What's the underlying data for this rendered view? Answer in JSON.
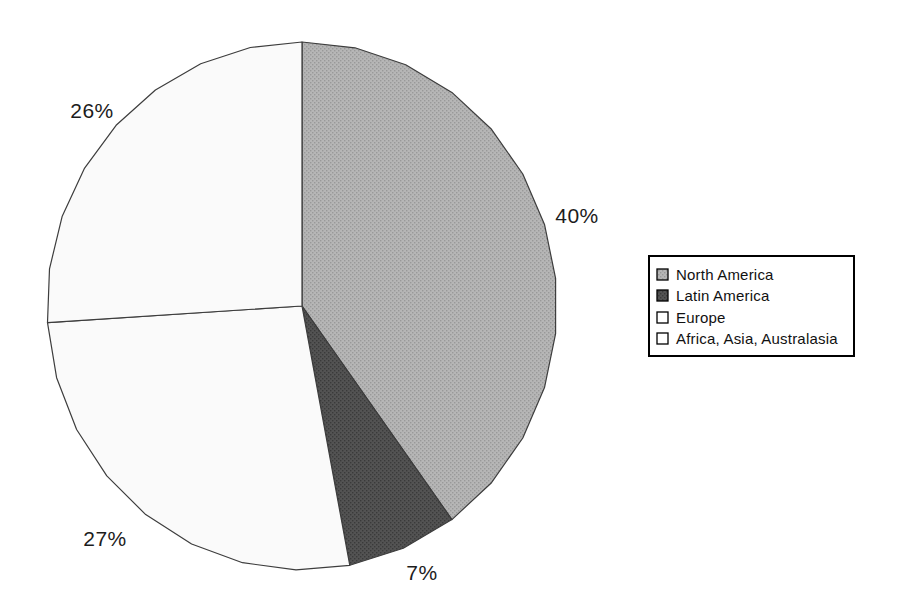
{
  "page": {
    "background_color": "#ffffff"
  },
  "chart_data": {
    "type": "pie",
    "title": "",
    "categories": [
      "North America",
      "Latin America",
      "Europe",
      "Africa, Asia, Australasia"
    ],
    "values": [
      40,
      7,
      27,
      26
    ],
    "unit": "%",
    "slice_labels": [
      "40%",
      "7%",
      "27%",
      "26%"
    ],
    "slice_styles": [
      {
        "fill": "#b6b6b6",
        "dot": "#999999"
      },
      {
        "fill": "#535353",
        "dot": "#3a3a3a"
      },
      {
        "fill": "#fafafa",
        "dot": null
      },
      {
        "fill": "#fafafa",
        "dot": null
      }
    ],
    "outline_color": "#3d3d3d",
    "start_angle_deg": 0,
    "direction": "clockwise",
    "legend_position": "right",
    "grid": false,
    "layout": {
      "center_x": 302,
      "center_y": 306,
      "radius_x": 255,
      "radius_y": 264,
      "segments_per_circle": 30,
      "label_positions": [
        {
          "x": 577,
          "y": 216
        },
        {
          "x": 422,
          "y": 573
        },
        {
          "x": 105,
          "y": 539
        },
        {
          "x": 92,
          "y": 111
        }
      ]
    }
  },
  "legend": {
    "border_color": "#000000",
    "background_color": "#ffffff",
    "items": [
      {
        "label": "North America"
      },
      {
        "label": "Latin America"
      },
      {
        "label": "Europe"
      },
      {
        "label": "Africa, Asia, Australasia"
      }
    ]
  }
}
